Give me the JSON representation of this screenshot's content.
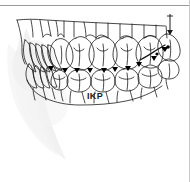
{
  "page": {
    "width": 190,
    "height": 182,
    "background_color": "#ffffff",
    "document_type": "scanned-figure"
  },
  "rules": {
    "top_rule_color": "#9a9a9a",
    "right_rule_color": "#c9c9c9"
  },
  "figure": {
    "name": "dental-occlusion-line-drawing",
    "ink_color": "#1a1a1a",
    "marker_color": "#000000",
    "shadow_color": "#ebebeb",
    "pointer_label": "f"
  },
  "caption": {
    "text": "IKP",
    "color": "#1b1b1b"
  }
}
